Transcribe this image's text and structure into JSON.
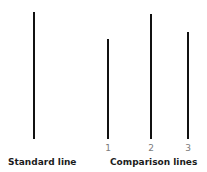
{
  "figure": {
    "background_color": "#ffffff",
    "line_color": "#111111",
    "label_color": "#1c1c1c",
    "number_color": "#7b7b7b"
  },
  "standard": {
    "caption": "Standard line",
    "line": {
      "id": "standard-line",
      "x": 33,
      "top": 12,
      "bottom": 139,
      "height": 127,
      "thickness": 2
    }
  },
  "comparison": {
    "caption": "Comparison lines",
    "lines": [
      {
        "id": "comparison-line-1",
        "number": "1",
        "x": 107,
        "top": 39,
        "bottom": 139,
        "height": 100,
        "thickness": 2
      },
      {
        "id": "comparison-line-2",
        "number": "2",
        "x": 150,
        "top": 14,
        "bottom": 139,
        "height": 125,
        "thickness": 2
      },
      {
        "id": "comparison-line-3",
        "number": "3",
        "x": 187,
        "top": 32,
        "bottom": 139,
        "height": 107,
        "thickness": 2
      }
    ]
  },
  "chart_data": {
    "type": "bar",
    "title": "",
    "xlabel": "",
    "ylabel": "",
    "orientation": "vertical",
    "grid": false,
    "legend": false,
    "categories": [
      "Standard",
      "1",
      "2",
      "3"
    ],
    "values": [
      127,
      100,
      125,
      107
    ],
    "units": "pixels",
    "groups": [
      {
        "name": "Standard line",
        "categories": [
          "Standard"
        ],
        "values": [
          127
        ]
      },
      {
        "name": "Comparison lines",
        "categories": [
          "1",
          "2",
          "3"
        ],
        "values": [
          100,
          125,
          107
        ]
      }
    ],
    "ylim": [
      0,
      127
    ],
    "baseline_y": 139
  }
}
